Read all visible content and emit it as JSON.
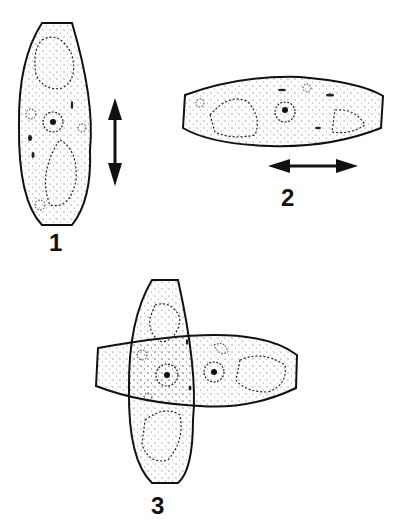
{
  "figure": {
    "panels": [
      {
        "id": "1",
        "label": "1",
        "shape": "cell-vertical",
        "arrow": "vertical double arrow"
      },
      {
        "id": "2",
        "label": "2",
        "shape": "cell-horizontal",
        "arrow": "horizontal double arrow"
      },
      {
        "id": "3",
        "label": "3",
        "shape": "cells-crossed",
        "arrow": ""
      }
    ],
    "colors": {
      "ink": "#111111",
      "background": "#ffffff"
    }
  }
}
